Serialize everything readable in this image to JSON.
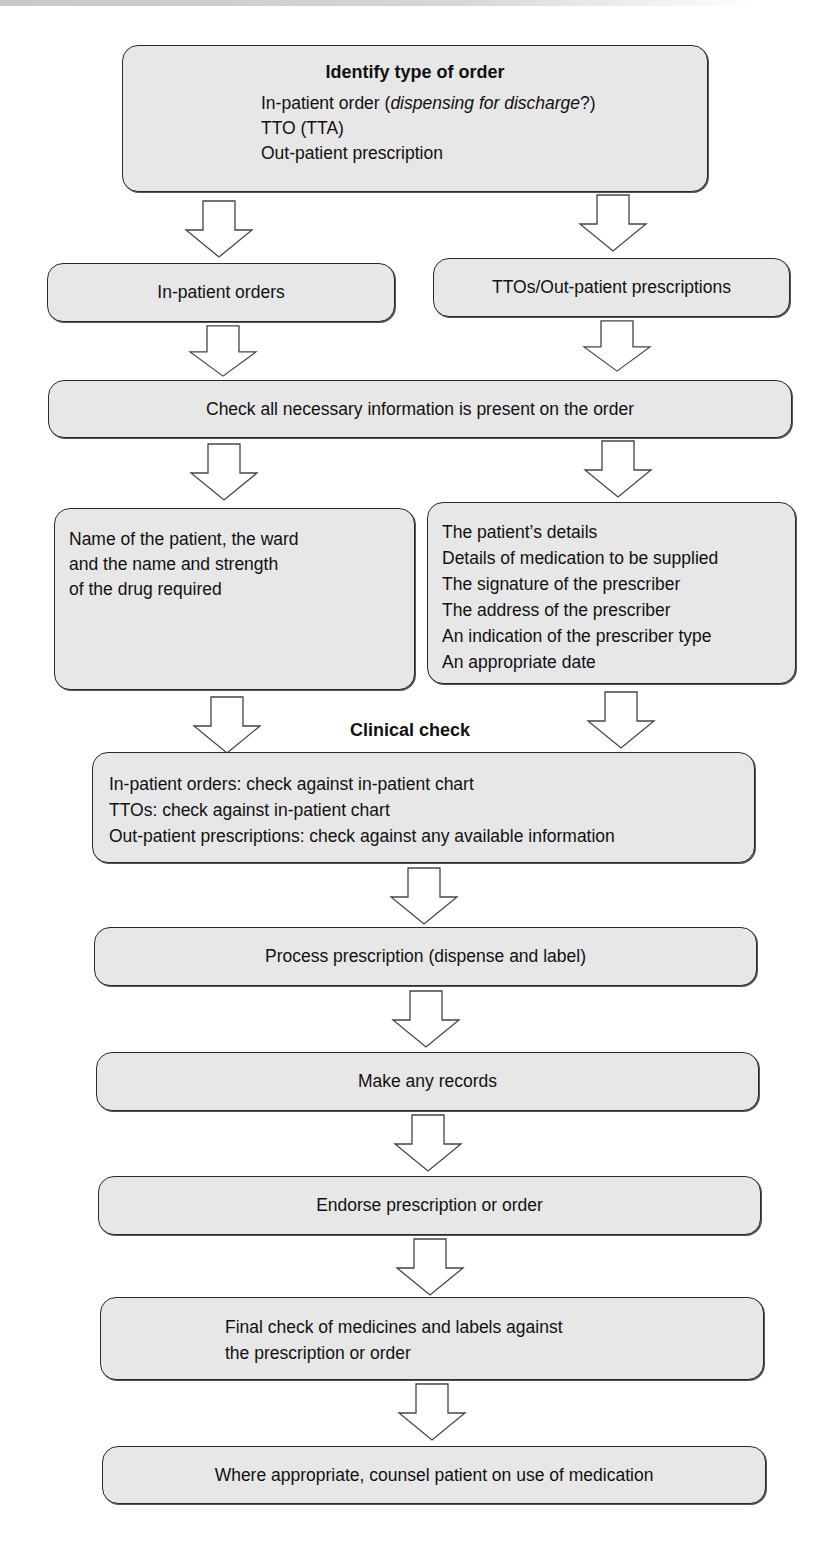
{
  "diagram": {
    "type": "flowchart",
    "colors": {
      "box_fill": "#e7e7e7",
      "box_border": "#2a2a2a",
      "arrow_fill": "#ffffff",
      "arrow_stroke": "#444444"
    },
    "nodes": {
      "identify": {
        "title": "Identify type of order",
        "lines": [
          {
            "text": "In-patient order (",
            "italic": "dispensing for discharge",
            "suffix": "?)"
          },
          {
            "text": "TTO (TTA)"
          },
          {
            "text": "Out-patient prescription"
          }
        ]
      },
      "inpatient_orders": {
        "label": "In-patient orders"
      },
      "tto_outpatient": {
        "label": "TTOs/Out-patient prescriptions"
      },
      "check_info": {
        "label": "Check all necessary information is present on the order"
      },
      "inpatient_details": {
        "lines": [
          "Name of the patient, the ward",
          "and the name and strength",
          "of the drug required"
        ]
      },
      "outpatient_details": {
        "lines": [
          "The patient’s details",
          "Details of medication to be supplied",
          "The signature of the prescriber",
          "The address of the prescriber",
          "An indication of the prescriber type",
          "An appropriate date"
        ]
      },
      "clinical_check_heading": {
        "label": "Clinical check"
      },
      "clinical_check": {
        "lines": [
          "In-patient orders: check against in-patient chart",
          "TTOs: check against in-patient chart",
          "Out-patient prescriptions: check against any available information"
        ]
      },
      "process": {
        "label": "Process prescription (dispense and label)"
      },
      "records": {
        "label": "Make any records"
      },
      "endorse": {
        "label": "Endorse prescription or order"
      },
      "final_check": {
        "lines": [
          "Final check of medicines and labels against",
          "the prescription or order"
        ]
      },
      "counsel": {
        "label": "Where appropriate, counsel patient on use of medication"
      }
    },
    "edges": [
      [
        "identify",
        "inpatient_orders"
      ],
      [
        "identify",
        "tto_outpatient"
      ],
      [
        "inpatient_orders",
        "check_info"
      ],
      [
        "tto_outpatient",
        "check_info"
      ],
      [
        "check_info",
        "inpatient_details"
      ],
      [
        "check_info",
        "outpatient_details"
      ],
      [
        "inpatient_details",
        "clinical_check"
      ],
      [
        "outpatient_details",
        "clinical_check"
      ],
      [
        "clinical_check",
        "process"
      ],
      [
        "process",
        "records"
      ],
      [
        "records",
        "endorse"
      ],
      [
        "endorse",
        "final_check"
      ],
      [
        "final_check",
        "counsel"
      ]
    ]
  }
}
